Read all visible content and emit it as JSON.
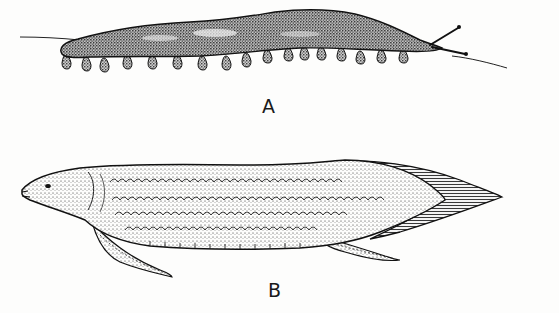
{
  "figure": {
    "panels": [
      {
        "id": "A",
        "label": "A",
        "subject": "segmented worm-like animal with paired stubby legs and antennae",
        "leg_count": 17
      },
      {
        "id": "B",
        "label": "B",
        "subject": "elongated lobe-finned fish with scaled body and pointed tail fin"
      }
    ],
    "colors": {
      "ink": "#1a1a1a",
      "paper": "#fdfdfc"
    }
  }
}
